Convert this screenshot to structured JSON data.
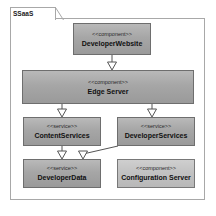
{
  "diagram": {
    "type": "uml-component-diagram",
    "package": {
      "name": "SSaaS"
    },
    "nodes": [
      {
        "id": "developer-website",
        "stereotype": "<<component>>",
        "name": "DeveloperWebsite",
        "shade": "dark"
      },
      {
        "id": "edge-server",
        "stereotype": "<<component>>",
        "name": "Edge Server",
        "shade": "dark"
      },
      {
        "id": "content-services",
        "stereotype": "<<service>>",
        "name": "ContentServices",
        "shade": "dark"
      },
      {
        "id": "developer-services",
        "stereotype": "<<service>>",
        "name": "DeveloperServices",
        "shade": "dark"
      },
      {
        "id": "developer-data",
        "stereotype": "<<service>>",
        "name": "DeveloperData",
        "shade": "dark"
      },
      {
        "id": "configuration-server",
        "stereotype": "<<component>>",
        "name": "Configuration Server",
        "shade": "light"
      }
    ],
    "connectors": [
      {
        "from": "developer-website",
        "to": "edge-server",
        "arrow": "hollow-triangle"
      },
      {
        "from": "edge-server",
        "to": "content-services",
        "arrow": "hollow-triangle"
      },
      {
        "from": "edge-server",
        "to": "developer-services",
        "arrow": "hollow-triangle"
      },
      {
        "from": "content-services",
        "to": "developer-data",
        "arrow": "hollow-triangle"
      },
      {
        "from": "developer-services",
        "to": "developer-data",
        "arrow": "hollow-triangle"
      }
    ],
    "colors": {
      "node_fill_dark": "#a6a6a6",
      "node_fill_light": "#c2c2c2",
      "node_border": "#6e6e6e",
      "frame_border": "#a8a8a8",
      "line": "#555555",
      "background": "#ffffff"
    }
  }
}
